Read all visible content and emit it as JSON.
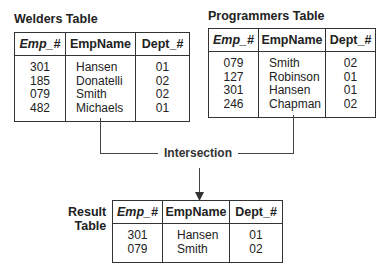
{
  "welders": {
    "title": "Welders Table",
    "headers": [
      "Emp_#",
      "EmpName",
      "Dept_#"
    ],
    "rows": [
      [
        "301",
        "Hansen",
        "01"
      ],
      [
        "185",
        "Donatelli",
        "02"
      ],
      [
        "079",
        "Smith",
        "02"
      ],
      [
        "482",
        "Michaels",
        "01"
      ]
    ]
  },
  "programmers": {
    "title": "Programmers Table",
    "headers": [
      "Emp_#",
      "EmpName",
      "Dept_#"
    ],
    "rows": [
      [
        "079",
        "Smith",
        "02"
      ],
      [
        "127",
        "Robinson",
        "01"
      ],
      [
        "301",
        "Hansen",
        "01"
      ],
      [
        "246",
        "Chapman",
        "02"
      ]
    ]
  },
  "operation": {
    "label": "Intersection"
  },
  "result": {
    "title_line1": "Result",
    "title_line2": "Table",
    "headers": [
      "Emp_#",
      "EmpName",
      "Dept_#"
    ],
    "rows": [
      [
        "301",
        "Hansen",
        "01"
      ],
      [
        "079",
        "Smith",
        "02"
      ]
    ]
  }
}
